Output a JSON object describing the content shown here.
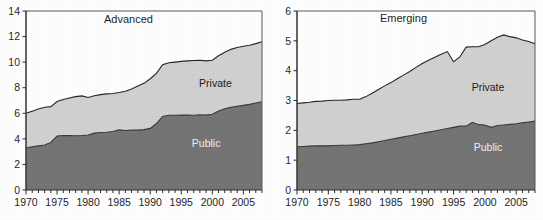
{
  "figure": {
    "background": "#ffffff",
    "private_color": "#d2d2d2",
    "public_color": "#757575",
    "line_color": "#262626",
    "axis_color": "#333333"
  },
  "chart_data": [
    {
      "type": "area",
      "title": "Advanced",
      "stacked": true,
      "xlabel": "",
      "ylabel": "",
      "xlim": [
        1970,
        2008
      ],
      "ylim": [
        0,
        14
      ],
      "ytick_values": [
        0,
        2,
        4,
        6,
        8,
        10,
        12,
        14
      ],
      "ytick_labels": [
        "0",
        "2",
        "4",
        "6",
        "8",
        "10",
        "12",
        "14"
      ],
      "xtick_values": [
        1970,
        1975,
        1980,
        1985,
        1990,
        1995,
        2000,
        2005
      ],
      "xtick_labels": [
        "1970",
        "1975",
        "1980",
        "1985",
        "1990",
        "1995",
        "2000",
        "2005"
      ],
      "minor_xticks_every": 1,
      "grid": false,
      "legend_position": "inline-annotations",
      "annotations": [
        {
          "text": "Advanced",
          "x": 1986.5,
          "y": 13.1
        },
        {
          "text": "Private",
          "x": 2000.5,
          "y": 8.05
        },
        {
          "text": "Public",
          "x": 1999.0,
          "y": 3.4
        }
      ],
      "x": [
        1970,
        1971,
        1972,
        1973,
        1974,
        1975,
        1976,
        1977,
        1978,
        1979,
        1980,
        1981,
        1982,
        1983,
        1984,
        1985,
        1986,
        1987,
        1988,
        1989,
        1990,
        1991,
        1992,
        1993,
        1994,
        1995,
        1996,
        1997,
        1998,
        1999,
        2000,
        2001,
        2002,
        2003,
        2004,
        2005,
        2006,
        2007,
        2008
      ],
      "series": [
        {
          "name": "Public",
          "values": [
            3.3,
            3.38,
            3.45,
            3.52,
            3.72,
            4.22,
            4.26,
            4.25,
            4.24,
            4.26,
            4.3,
            4.45,
            4.5,
            4.52,
            4.58,
            4.7,
            4.65,
            4.68,
            4.68,
            4.72,
            4.82,
            5.2,
            5.75,
            5.85,
            5.85,
            5.86,
            5.86,
            5.85,
            5.88,
            5.86,
            5.92,
            6.18,
            6.35,
            6.46,
            6.55,
            6.62,
            6.7,
            6.8,
            6.9
          ]
        },
        {
          "name": "Private",
          "values": [
            2.7,
            2.78,
            2.88,
            2.95,
            2.8,
            2.7,
            2.82,
            2.94,
            3.06,
            3.1,
            2.94,
            2.92,
            2.96,
            3.0,
            2.97,
            2.92,
            3.08,
            3.22,
            3.45,
            3.62,
            3.88,
            3.92,
            4.05,
            4.1,
            4.15,
            4.2,
            4.24,
            4.28,
            4.27,
            4.24,
            4.23,
            4.32,
            4.42,
            4.54,
            4.6,
            4.62,
            4.62,
            4.65,
            4.7
          ]
        }
      ],
      "totals": [
        6.0,
        6.16,
        6.33,
        6.47,
        6.52,
        6.92,
        7.08,
        7.19,
        7.3,
        7.36,
        7.24,
        7.37,
        7.46,
        7.52,
        7.55,
        7.62,
        7.73,
        7.9,
        8.13,
        8.34,
        8.7,
        9.12,
        9.8,
        9.95,
        10.0,
        10.06,
        10.1,
        10.13,
        10.15,
        10.1,
        10.15,
        10.5,
        10.77,
        11.0,
        11.15,
        11.24,
        11.32,
        11.45,
        11.6
      ]
    },
    {
      "type": "area",
      "title": "Emerging",
      "stacked": true,
      "xlabel": "",
      "ylabel": "",
      "xlim": [
        1970,
        2008
      ],
      "ylim": [
        0,
        6
      ],
      "ytick_values": [
        0,
        1,
        2,
        3,
        4,
        5,
        6
      ],
      "ytick_labels": [
        "0",
        "1",
        "2",
        "3",
        "4",
        "5",
        "6"
      ],
      "xtick_values": [
        1970,
        1975,
        1980,
        1985,
        1990,
        1995,
        2000,
        2005
      ],
      "xtick_labels": [
        "1970",
        "1975",
        "1980",
        "1985",
        "1990",
        "1995",
        "2000",
        "2005"
      ],
      "minor_xticks_every": 1,
      "grid": false,
      "legend_position": "inline-annotations",
      "annotations": [
        {
          "text": "Emerging",
          "x": 1987.0,
          "y": 5.62
        },
        {
          "text": "Private",
          "x": 2000.5,
          "y": 3.33
        },
        {
          "text": "Public",
          "x": 2000.5,
          "y": 1.32
        }
      ],
      "x": [
        1970,
        1971,
        1972,
        1973,
        1974,
        1975,
        1976,
        1977,
        1978,
        1979,
        1980,
        1981,
        1982,
        1983,
        1984,
        1985,
        1986,
        1987,
        1988,
        1989,
        1990,
        1991,
        1992,
        1993,
        1994,
        1995,
        1996,
        1997,
        1998,
        1999,
        2000,
        2001,
        2002,
        2003,
        2004,
        2005,
        2006,
        2007,
        2008
      ],
      "series": [
        {
          "name": "Public",
          "values": [
            1.45,
            1.46,
            1.47,
            1.48,
            1.48,
            1.48,
            1.49,
            1.5,
            1.5,
            1.51,
            1.52,
            1.55,
            1.58,
            1.62,
            1.66,
            1.7,
            1.74,
            1.78,
            1.82,
            1.86,
            1.9,
            1.94,
            1.98,
            2.02,
            2.06,
            2.1,
            2.14,
            2.14,
            2.27,
            2.19,
            2.18,
            2.1,
            2.16,
            2.18,
            2.2,
            2.22,
            2.25,
            2.28,
            2.31
          ]
        },
        {
          "name": "Private",
          "values": [
            1.45,
            1.46,
            1.47,
            1.49,
            1.5,
            1.52,
            1.52,
            1.51,
            1.52,
            1.53,
            1.52,
            1.58,
            1.66,
            1.75,
            1.83,
            1.9,
            1.99,
            2.07,
            2.15,
            2.25,
            2.34,
            2.41,
            2.47,
            2.53,
            2.58,
            2.2,
            2.32,
            2.65,
            2.53,
            2.61,
            2.7,
            2.9,
            2.96,
            3.02,
            2.94,
            2.88,
            2.78,
            2.7,
            2.59
          ]
        }
      ],
      "totals": [
        2.9,
        2.92,
        2.94,
        2.97,
        2.98,
        3.0,
        3.01,
        3.01,
        3.02,
        3.04,
        3.04,
        3.13,
        3.24,
        3.37,
        3.49,
        3.6,
        3.73,
        3.85,
        3.97,
        4.11,
        4.24,
        4.35,
        4.45,
        4.55,
        4.64,
        4.3,
        4.46,
        4.79,
        4.8,
        4.8,
        4.88,
        5.0,
        5.12,
        5.2,
        5.14,
        5.1,
        5.03,
        4.98,
        4.9
      ]
    }
  ]
}
